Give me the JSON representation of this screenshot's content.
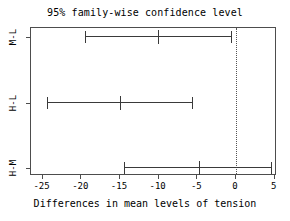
{
  "chart_data": {
    "type": "bar",
    "plot_kind": "tukey-hsd-confidence-intervals",
    "title": "95% family-wise confidence level",
    "xlabel": "Differences in mean levels of tension",
    "ylabel": "",
    "xlim": [
      -26.5,
      5.3
    ],
    "ylim": [
      0,
      3
    ],
    "grid": false,
    "legend": false,
    "zero_reference_line": {
      "value": 0,
      "style": "dotted",
      "color": "#555555"
    },
    "xticks": [
      -25,
      -20,
      -15,
      -10,
      -5,
      0,
      5
    ],
    "xtick_labels": [
      "-25",
      "-20",
      "-15",
      "-10",
      "-5",
      "0",
      "5"
    ],
    "categories": [
      "M-L",
      "H-L",
      "H-M"
    ],
    "series": [
      {
        "name": "difference",
        "values": [
          -9.9,
          -14.9,
          -4.7
        ]
      },
      {
        "name": "lower",
        "values": [
          -19.4,
          -24.3,
          -14.4
        ]
      },
      {
        "name": "upper",
        "values": [
          -0.5,
          -5.5,
          4.7
        ]
      }
    ],
    "intervals": [
      {
        "comparison": "M-L",
        "diff": -9.9,
        "lower": -19.4,
        "upper": -0.5
      },
      {
        "comparison": "H-L",
        "diff": -14.9,
        "lower": -24.3,
        "upper": -5.5
      },
      {
        "comparison": "H-M",
        "diff": -4.7,
        "lower": -14.4,
        "upper": 4.7
      }
    ],
    "colors": {
      "line": "#3a3a3a",
      "frame": "#4d4d4d",
      "zero": "#555555",
      "background": "#ffffff"
    }
  }
}
